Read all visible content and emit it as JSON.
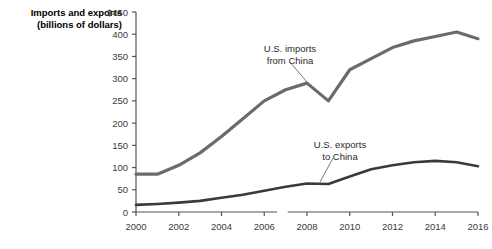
{
  "chart_data": {
    "type": "line",
    "title": "",
    "ylabel_lines": [
      "Imports and exports",
      "(billions of dollars)"
    ],
    "xlabel": "",
    "ylim": [
      0,
      450
    ],
    "xlim": [
      2000,
      2016
    ],
    "yticks": [
      0,
      50,
      100,
      150,
      200,
      250,
      300,
      350,
      400,
      450
    ],
    "ytick_labels": [
      "0",
      "50",
      "100",
      "150",
      "200",
      "250",
      "300",
      "350",
      "400",
      "$450"
    ],
    "xticks": [
      2000,
      2001,
      2002,
      2003,
      2004,
      2005,
      2006,
      2007,
      2008,
      2009,
      2010,
      2011,
      2012,
      2013,
      2014,
      2015,
      2016
    ],
    "xtick_labels_major": [
      "2000",
      "2002",
      "2004",
      "2006",
      "2008",
      "2010",
      "2012",
      "2014",
      "2016"
    ],
    "xticks_major": [
      2000,
      2002,
      2004,
      2006,
      2008,
      2010,
      2012,
      2014,
      2016
    ],
    "grid": false,
    "legend_position": "inline-annotations",
    "x": [
      2000,
      2001,
      2002,
      2003,
      2004,
      2005,
      2006,
      2007,
      2008,
      2009,
      2010,
      2011,
      2012,
      2013,
      2014,
      2015,
      2016
    ],
    "series": [
      {
        "name": "U.S. imports from China",
        "color": "#6b6b6b",
        "width": 3.2,
        "values": [
          85,
          85,
          105,
          133,
          170,
          210,
          250,
          275,
          290,
          250,
          320,
          345,
          370,
          385,
          395,
          405,
          390
        ]
      },
      {
        "name": "U.S. exports to China",
        "color": "#3a3a3a",
        "width": 2.6,
        "values": [
          16,
          18,
          21,
          25,
          32,
          39,
          48,
          57,
          64,
          63,
          80,
          96,
          105,
          112,
          115,
          112,
          103
        ]
      }
    ],
    "annotations": [
      {
        "text_lines": [
          "U.S. imports",
          "from China"
        ],
        "text_x": 290,
        "text_y": 52,
        "anchor": "middle",
        "leader": {
          "x1": 290,
          "y1": 62,
          "x2": 312,
          "y2": 88
        }
      },
      {
        "text_lines": [
          "U.S. exports",
          "to China"
        ],
        "text_x": 340,
        "text_y": 148,
        "anchor": "middle",
        "leader": {
          "x1": 333,
          "y1": 158,
          "x2": 320,
          "y2": 182
        }
      }
    ]
  },
  "axis": {
    "axis_color": "#555555",
    "tick_color": "#555555",
    "baseline_note": ""
  }
}
